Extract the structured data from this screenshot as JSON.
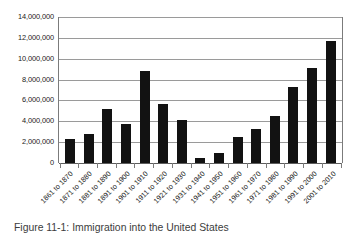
{
  "caption": "Figure 11-1: Immigration into the United States",
  "chart_data": {
    "type": "bar",
    "title": "",
    "xlabel": "",
    "ylabel": "",
    "ylim": [
      0,
      14000000
    ],
    "ytick_step": 2000000,
    "grid": true,
    "legend": false,
    "bar_color": "#121212",
    "gridline_color": "#9a9a9a",
    "axis_color": "#7b7b7b",
    "xtick_labels_rotation": "-45",
    "ytick_labels": [
      "14,000,000",
      "12,000,000",
      "10,000,000",
      "8,000,000",
      "6,000,000",
      "4,000,000",
      "2,000,000",
      "0"
    ],
    "ytick_values": [
      14000000,
      12000000,
      10000000,
      8000000,
      6000000,
      4000000,
      2000000,
      0
    ],
    "categories": [
      "1861 to 1870",
      "1871 to 1880",
      "1881 to 1890",
      "1891 to 1900",
      "1901 to 1910",
      "1911 to 1920",
      "1921 to 1930",
      "1931 to 1940",
      "1941 to 1950",
      "1951 to 1960",
      "1961 to 1970",
      "1971 to 1980",
      "1981 to 1990",
      "1991 to 2000",
      "2001 to 2010"
    ],
    "values": [
      2300000,
      2800000,
      5200000,
      3700000,
      8800000,
      5700000,
      4100000,
      500000,
      1000000,
      2500000,
      3300000,
      4500000,
      7300000,
      9100000,
      11700000
    ]
  }
}
